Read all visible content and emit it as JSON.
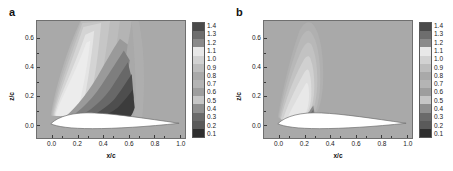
{
  "figure": {
    "background": "#ffffff",
    "plot_background": "#a9a9a9",
    "airfoil_color": "#ffffff"
  },
  "panels": [
    {
      "label": "a",
      "xlabel": "x/c",
      "ylabel": "z/c"
    },
    {
      "label": "b",
      "xlabel": "x/c",
      "ylabel": "z/c"
    }
  ],
  "axes": {
    "x_ticks": [
      "0.0",
      "0.2",
      "0.4",
      "0.6",
      "0.8",
      "1.0"
    ],
    "x_values": [
      0.0,
      0.2,
      0.4,
      0.6,
      0.8,
      1.0
    ],
    "y_ticks": [
      "0.0",
      "0.2",
      "0.4",
      "0.6"
    ],
    "y_values": [
      0.0,
      0.2,
      0.4,
      0.6
    ],
    "xlim": [
      -0.08,
      1.08
    ],
    "ylim": [
      -0.09,
      0.72
    ]
  },
  "colorbar": {
    "ticks": [
      "1.4",
      "1.3",
      "1.2",
      "1.1",
      "1.0",
      "0.9",
      "0.8",
      "0.7",
      "0.6",
      "0.5",
      "0.4",
      "0.3",
      "0.2",
      "0.1"
    ],
    "values": [
      1.4,
      1.3,
      1.2,
      1.1,
      1.0,
      0.9,
      0.8,
      0.7,
      0.6,
      0.5,
      0.4,
      0.3,
      0.2,
      0.1
    ],
    "colors": [
      "#4a4a4a",
      "#6e6e6e",
      "#8a8a8a",
      "#e8e8e8",
      "#d2d2d2",
      "#bdbdbd",
      "#a9a9a9",
      "#b4b4b4",
      "#9e9e9e",
      "#c6c6c6",
      "#8f8f8f",
      "#6a6a6a",
      "#5a5a5a",
      "#2e2e2e"
    ]
  },
  "chart_data": {
    "type": "heatmap",
    "title": "",
    "xlabel": "x/c",
    "ylabel": "z/c",
    "grid": false,
    "legend_position": "right",
    "colorbar_range": [
      0.1,
      1.4
    ],
    "colorbar_step": 0.1,
    "panels": [
      {
        "label": "a",
        "description": "Contour plume above airfoil, wide fan spreading upward and downstream with a dark high-value core adjacent to the upper surface",
        "peak_value": 1.4,
        "peak_location": {
          "x_c": 0.45,
          "z_c": 0.08
        },
        "plume_extent": {
          "x_c": [
            0.05,
            0.68
          ],
          "z_c": [
            0.0,
            0.72
          ]
        },
        "contour_levels": [
          0.1,
          0.2,
          0.3,
          0.4,
          0.5,
          0.6,
          0.7,
          0.8,
          0.9,
          1.0,
          1.1,
          1.2,
          1.3,
          1.4
        ]
      },
      {
        "label": "b",
        "description": "Narrower, weaker contour plume above airfoil with small dark patch near mid-chord",
        "peak_value": 1.2,
        "peak_location": {
          "x_c": 0.4,
          "z_c": 0.07
        },
        "plume_extent": {
          "x_c": [
            0.05,
            0.5
          ],
          "z_c": [
            0.0,
            0.7
          ]
        },
        "contour_levels": [
          0.1,
          0.2,
          0.3,
          0.4,
          0.5,
          0.6,
          0.7,
          0.8,
          0.9,
          1.0,
          1.1,
          1.2
        ]
      }
    ],
    "airfoil": {
      "chord_range": [
        0.0,
        1.0
      ],
      "max_thickness_location": 0.25,
      "max_thickness": 0.06
    }
  }
}
